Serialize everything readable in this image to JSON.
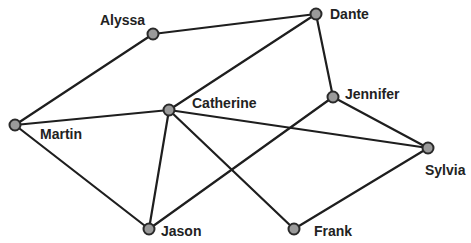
{
  "graph": {
    "type": "undirected network",
    "nodes": [
      {
        "id": "alyssa",
        "label": "Alyssa",
        "x": 153,
        "y": 34,
        "lx": 100,
        "ly": 25
      },
      {
        "id": "dante",
        "label": "Dante",
        "x": 316,
        "y": 14,
        "lx": 330,
        "ly": 19
      },
      {
        "id": "catherine",
        "label": "Catherine",
        "x": 169,
        "y": 110,
        "lx": 192,
        "ly": 108
      },
      {
        "id": "jennifer",
        "label": "Jennifer",
        "x": 333,
        "y": 97,
        "lx": 345,
        "ly": 99
      },
      {
        "id": "martin",
        "label": "Martin",
        "x": 15,
        "y": 125,
        "lx": 40,
        "ly": 139
      },
      {
        "id": "sylvia",
        "label": "Sylvia",
        "x": 428,
        "y": 148,
        "lx": 425,
        "ly": 175
      },
      {
        "id": "jason",
        "label": "Jason",
        "x": 149,
        "y": 229,
        "lx": 161,
        "ly": 236
      },
      {
        "id": "frank",
        "label": "Frank",
        "x": 294,
        "y": 229,
        "lx": 314,
        "ly": 236
      }
    ],
    "edges": [
      [
        "alyssa",
        "dante"
      ],
      [
        "alyssa",
        "martin"
      ],
      [
        "dante",
        "catherine"
      ],
      [
        "dante",
        "jennifer"
      ],
      [
        "martin",
        "catherine"
      ],
      [
        "martin",
        "jason"
      ],
      [
        "catherine",
        "jason"
      ],
      [
        "catherine",
        "frank"
      ],
      [
        "catherine",
        "sylvia"
      ],
      [
        "jennifer",
        "jason"
      ],
      [
        "jennifer",
        "sylvia"
      ],
      [
        "sylvia",
        "frank"
      ]
    ]
  },
  "colors": {
    "edge": "#1e1e1e",
    "node_fill": "#9a9a9a",
    "node_stroke": "#2a2a2a",
    "label": "#222222",
    "background": "#ffffff"
  }
}
